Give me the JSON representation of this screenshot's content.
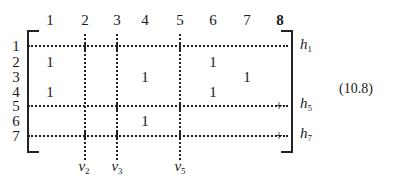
{
  "equation_number": "(10.8)",
  "matrix": {
    "column_headers": [
      "1",
      "2",
      "3",
      "4",
      "5",
      "6",
      "7",
      "8"
    ],
    "row_headers": [
      "1",
      "2",
      "3",
      "4",
      "5",
      "6",
      "7"
    ],
    "entries": [
      {
        "row": 2,
        "col": 1,
        "value": "1"
      },
      {
        "row": 2,
        "col": 6,
        "value": "1"
      },
      {
        "row": 3,
        "col": 4,
        "value": "1"
      },
      {
        "row": 3,
        "col": 7,
        "value": "1"
      },
      {
        "row": 4,
        "col": 1,
        "value": "1"
      },
      {
        "row": 4,
        "col": 6,
        "value": "1"
      },
      {
        "row": 6,
        "col": 4,
        "value": "1"
      }
    ],
    "horizontal_lines": [
      {
        "row": 1,
        "label": "h",
        "sub": "1"
      },
      {
        "row": 5,
        "label": "h",
        "sub": "5"
      },
      {
        "row": 7,
        "label": "h",
        "sub": "7"
      }
    ],
    "vertical_lines": [
      {
        "col": 2,
        "label": "v",
        "sub": "2"
      },
      {
        "col": 3,
        "label": "v",
        "sub": "3"
      },
      {
        "col": 5,
        "label": "v",
        "sub": "5"
      }
    ]
  }
}
